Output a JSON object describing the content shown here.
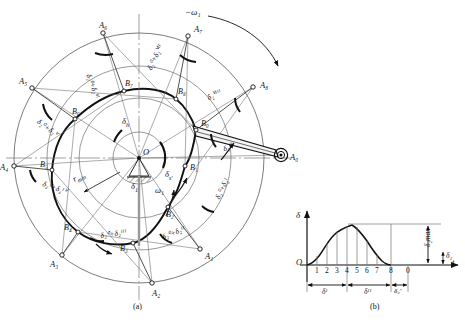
{
  "figure": {
    "panel_a_caption": "(a)",
    "panel_b_caption": "(b)",
    "omega_label": "−ω₁",
    "omega1_inner": "ω₁",
    "center_label": "O",
    "rmin_label": "r",
    "rmin_sub": "min"
  },
  "panel_a": {
    "a_points": [
      {
        "name": "A₀",
        "x": 281,
        "y": 155
      },
      {
        "name": "A₁",
        "x": 200,
        "y": 249
      },
      {
        "name": "A₂",
        "x": 152,
        "y": 283
      },
      {
        "name": "A₃",
        "x": 62,
        "y": 255
      },
      {
        "name": "A₄",
        "x": 14,
        "y": 166
      },
      {
        "name": "A₅",
        "x": 32,
        "y": 88
      },
      {
        "name": "A₆",
        "x": 103,
        "y": 33
      },
      {
        "name": "A₇",
        "x": 188,
        "y": 36
      },
      {
        "name": "A₈",
        "x": 253,
        "y": 87
      }
    ],
    "b_points": [
      {
        "name": "B₀",
        "x": 196,
        "y": 130
      },
      {
        "name": "B₁",
        "x": 185,
        "y": 166
      },
      {
        "name": "B₂",
        "x": 168,
        "y": 207
      },
      {
        "name": "B₃",
        "x": 133,
        "y": 243
      },
      {
        "name": "B₄",
        "x": 78,
        "y": 232
      },
      {
        "name": "B₅",
        "x": 52,
        "y": 170
      },
      {
        "name": "B₆",
        "x": 75,
        "y": 119
      },
      {
        "name": "B₇",
        "x": 124,
        "y": 91
      },
      {
        "name": "B₈",
        "x": 176,
        "y": 99
      }
    ],
    "angle_labels": [
      {
        "text": "δ₂⁰",
        "x": 222,
        "y": 146,
        "rot": -22
      },
      {
        "text": "δ₂⁰+δ₂ᴵ",
        "x": 214,
        "y": 197,
        "rot": -64
      },
      {
        "text": "δ₂⁰+δ₂ᴵᴵ",
        "x": 161,
        "y": 234,
        "rot": -22
      },
      {
        "text": "δ₂⁰+δ₂ᴵᴵᴵ",
        "x": 100,
        "y": 232,
        "rot": -8
      },
      {
        "text": "δ₂⁰+δ₂ᴵⱽ",
        "x": 44,
        "y": 180,
        "rot": 20
      },
      {
        "text": "δ₂⁰+δ₂ⱽ",
        "x": 40,
        "y": 118,
        "rot": 36
      },
      {
        "text": "δ₂⁰+δ₂ⱽᴵ",
        "x": 92,
        "y": 73,
        "rot": 70
      },
      {
        "text": "δ₂⁰+δ₂ⱽᴵᴵ",
        "x": 146,
        "y": 68,
        "rot": -65
      },
      {
        "text": "δ₂ⱽᴵᴵᴵ",
        "x": 206,
        "y": 95,
        "rot": -28
      }
    ],
    "delta_h": "δ",
    "delta_h_sub": "h",
    "delta_s": "δ",
    "delta_s_sub": "s'",
    "delta_1": "δ",
    "delta_1_sub": "1"
  },
  "panel_b": {
    "y_axis_label": "δ",
    "x_axis_label": "t",
    "origin_label": "O",
    "ticks": [
      "1",
      "2",
      "3",
      "4",
      "5",
      "6",
      "7",
      "8",
      "0"
    ],
    "delta_max_label": "δ₂max",
    "delta_1_label": "δ₁",
    "span_rise": "δᴵ",
    "span_dwell": "δᴵᴵ",
    "span_return": "δ₂'",
    "curve_points": [
      {
        "t": 0,
        "d": 0
      },
      {
        "t": 1,
        "d": 0.07
      },
      {
        "t": 2,
        "d": 0.3
      },
      {
        "t": 3,
        "d": 0.62
      },
      {
        "t": 4,
        "d": 0.92
      },
      {
        "t": 4.4,
        "d": 1.0
      },
      {
        "t": 5,
        "d": 0.93
      },
      {
        "t": 6,
        "d": 0.68
      },
      {
        "t": 7,
        "d": 0.33
      },
      {
        "t": 8,
        "d": 0.03
      },
      {
        "t": 8.2,
        "d": 0
      }
    ]
  },
  "chart_data": {
    "type": "line",
    "title": "",
    "xlabel": "t",
    "ylabel": "δ",
    "x": [
      0,
      1,
      2,
      3,
      4,
      4.4,
      5,
      6,
      7,
      8,
      8.2
    ],
    "values": [
      0,
      0.07,
      0.3,
      0.62,
      0.92,
      1.0,
      0.93,
      0.68,
      0.33,
      0.03,
      0
    ],
    "tick_labels": [
      "1",
      "2",
      "3",
      "4",
      "5",
      "6",
      "7",
      "8",
      "0"
    ],
    "annotations": [
      "δ₂max",
      "δ₁",
      "δᴵ",
      "δᴵᴵ",
      "δ₂'"
    ],
    "grid": false,
    "legend": "none"
  },
  "colors": {
    "ink": "#111111",
    "thin": "#555555",
    "axis": "#000000"
  }
}
